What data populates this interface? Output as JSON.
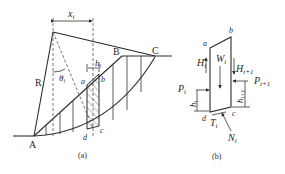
{
  "figure_a": {
    "caption": "(a)",
    "points": {
      "A": "A",
      "B": "B",
      "C": "C",
      "a": "a",
      "b": "b",
      "c": "c",
      "d": "d"
    },
    "labels": {
      "radius": "R",
      "x_dim": "x",
      "x_sub": "i",
      "b_dim": "b",
      "b_sub": "i",
      "theta": "θ",
      "theta_sub": "i"
    }
  },
  "figure_b": {
    "caption": "(b)",
    "points": {
      "a": "a",
      "b": "b",
      "c": "c",
      "d": "d"
    },
    "labels": {
      "W": "W",
      "W_sub": "i",
      "H_left": "H",
      "H_left_sub": "i",
      "H_right": "H",
      "H_right_sub": "i+1",
      "P_left": "P",
      "P_left_sub": "i",
      "P_right": "P",
      "P_right_sub": "i+1",
      "h_left": "h",
      "h_left_sub": "i",
      "h_right": "h",
      "h_right_sub": "i+1",
      "T": "T",
      "T_sub": "i",
      "N": "N",
      "N_sub": "i"
    }
  }
}
